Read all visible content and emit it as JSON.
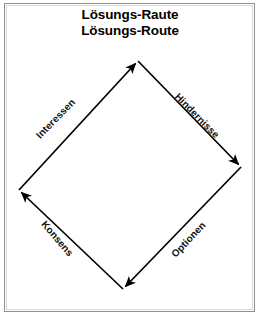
{
  "figure": {
    "width": 260,
    "height": 316,
    "background_color": "#ffffff",
    "border_color": "#8f8f8f",
    "stroke_color": "#000000"
  },
  "title": {
    "line1": "Lösungs-Raute",
    "line2": "Lösungs-Route"
  },
  "diagram": {
    "shape": "diamond",
    "vertices": {
      "top": {
        "x": 138,
        "y": 61
      },
      "right": {
        "x": 241,
        "y": 167
      },
      "bottom": {
        "x": 123,
        "y": 289
      },
      "left": {
        "x": 19,
        "y": 190
      }
    },
    "edges": [
      {
        "id": "interessen",
        "label": "Interessen",
        "from": "left",
        "to": "top",
        "arrow_at": "top",
        "direction": "up-right"
      },
      {
        "id": "hindernisse",
        "label": "Hindernisse",
        "from": "top",
        "to": "right",
        "arrow_at": "right",
        "direction": "down-right"
      },
      {
        "id": "optionen",
        "label": "Optionen",
        "from": "right",
        "to": "bottom",
        "arrow_at": "bottom",
        "direction": "down-left"
      },
      {
        "id": "konsens",
        "label": "Konsens",
        "from": "bottom",
        "to": "left",
        "arrow_at": "left",
        "direction": "up-left"
      }
    ]
  }
}
